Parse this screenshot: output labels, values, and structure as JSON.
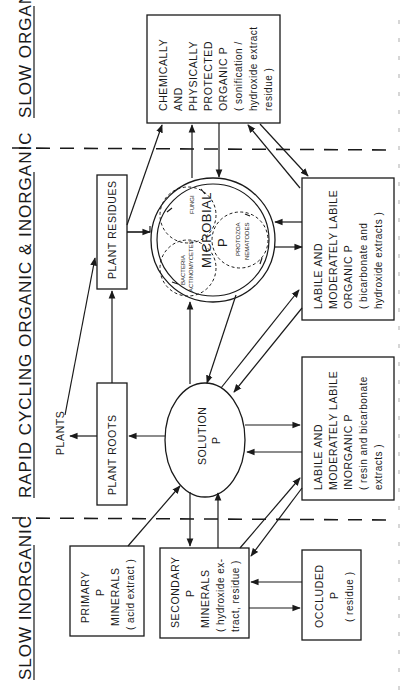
{
  "diagram": {
    "orientation": "rotated 90 degrees counter-clockwise (text reads bottom to top)",
    "zones": [
      {
        "id": "slow-organic",
        "label": "SLOW ORGANIC"
      },
      {
        "id": "rapid-cycling",
        "label": "RAPID CYCLING ORGANIC & INORGANIC"
      },
      {
        "id": "slow-inorganic",
        "label": "SLOW INORGANIC"
      }
    ],
    "nodes": {
      "protected_organic": {
        "lines": [
          "CHEMICALLY",
          "AND",
          "PHYSICALLY",
          "PROTECTED",
          "ORGANIC P",
          "( sonification /",
          "hydroxide extract",
          "residue )"
        ]
      },
      "plant_residues": {
        "label": "PLANT RESIDUES"
      },
      "microbial": {
        "label": "MICROBIAL",
        "sub": "P",
        "groups": [
          "FUNGI",
          "BACTERIA",
          "ACTINOMYCETES",
          "PROTOZOA",
          "NEMATODES"
        ]
      },
      "labile_organic": {
        "lines": [
          "LABILE AND",
          "MODERATELY LABILE",
          "ORGANIC P",
          "( bicarbonate and",
          "hydroxide extracts )"
        ]
      },
      "plants": {
        "label": "PLANTS"
      },
      "plant_roots": {
        "label": "PLANT ROOTS"
      },
      "solution": {
        "lines": [
          "SOLUTION",
          "P"
        ]
      },
      "labile_inorganic": {
        "lines": [
          "LABILE AND",
          "MODERATELY LABILE",
          "INORGANIC P",
          "( resin and bicarbonate",
          "extracts )"
        ]
      },
      "primary_minerals": {
        "lines": [
          "PRIMARY",
          "P",
          "MINERALS",
          "( acid extract )"
        ]
      },
      "secondary_minerals": {
        "lines": [
          "SECONDARY",
          "P",
          "MINERALS",
          "( hydroxide ex-",
          "tract, residue )"
        ]
      },
      "occluded": {
        "lines": [
          "OCCLUDED",
          "P",
          "( residue )"
        ]
      }
    },
    "caption_visible": false
  }
}
